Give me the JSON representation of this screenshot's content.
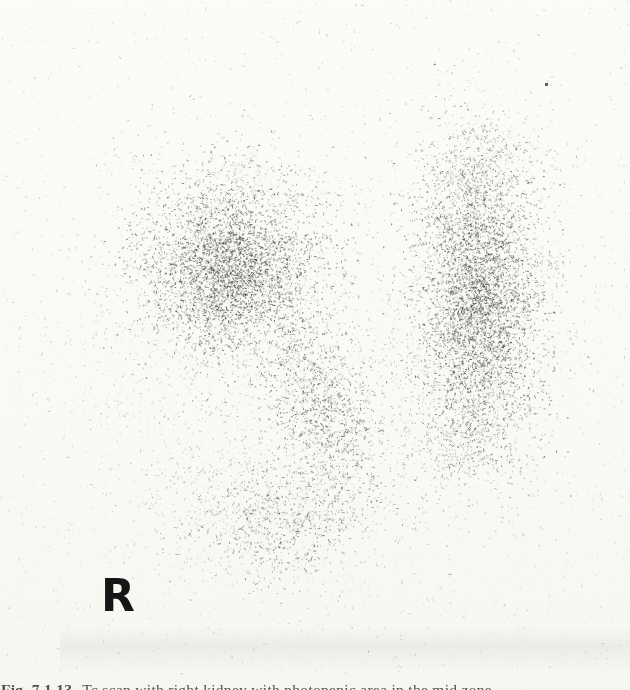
{
  "figure": {
    "orientation_label": "R",
    "caption_label": "Fig. 7.1.13",
    "caption_text": "Tc scan with right kidney with photopenic area in the mid zone"
  },
  "scan": {
    "width": 630,
    "height": 690,
    "seed": 42,
    "background": "#fbfaf7",
    "dot_color_rgb": "40,40,40",
    "clusters": [
      {
        "name": "left-upper-pole-dense",
        "cx": 233,
        "cy": 262,
        "sx": 52,
        "sy": 46,
        "n": 2600,
        "a": 0.5,
        "rot": 0
      },
      {
        "name": "left-upper-pole-core",
        "cx": 226,
        "cy": 278,
        "sx": 33,
        "sy": 34,
        "n": 1700,
        "a": 0.55,
        "rot": 0
      },
      {
        "name": "left-apex-sparse",
        "cx": 228,
        "cy": 182,
        "sx": 42,
        "sy": 24,
        "n": 260,
        "a": 0.32,
        "rot": 0
      },
      {
        "name": "left-medial-band",
        "cx": 322,
        "cy": 405,
        "sx": 26,
        "sy": 52,
        "n": 1300,
        "a": 0.48,
        "rot": -0.33
      },
      {
        "name": "left-lower-pole-blob",
        "cx": 288,
        "cy": 520,
        "sx": 42,
        "sy": 30,
        "n": 800,
        "a": 0.45,
        "rot": -0.15
      },
      {
        "name": "left-lower-lateral-sparse",
        "cx": 222,
        "cy": 500,
        "sx": 45,
        "sy": 35,
        "n": 300,
        "a": 0.3,
        "rot": 0
      },
      {
        "name": "left-field-halo",
        "cx": 252,
        "cy": 395,
        "sx": 85,
        "sy": 115,
        "n": 900,
        "a": 0.26,
        "rot": 0
      },
      {
        "name": "left-lateral-sparse",
        "cx": 140,
        "cy": 360,
        "sx": 48,
        "sy": 85,
        "n": 200,
        "a": 0.22,
        "rot": 0
      },
      {
        "name": "right-field-main",
        "cx": 481,
        "cy": 300,
        "sx": 36,
        "sy": 80,
        "n": 3000,
        "a": 0.5,
        "rot": 0
      },
      {
        "name": "right-field-core",
        "cx": 477,
        "cy": 305,
        "sx": 24,
        "sy": 56,
        "n": 1700,
        "a": 0.55,
        "rot": 0
      },
      {
        "name": "right-upper-taper",
        "cx": 472,
        "cy": 190,
        "sx": 26,
        "sy": 30,
        "n": 450,
        "a": 0.4,
        "rot": 0
      },
      {
        "name": "right-apex-sparse",
        "cx": 487,
        "cy": 148,
        "sx": 24,
        "sy": 22,
        "n": 220,
        "a": 0.3,
        "rot": 0
      },
      {
        "name": "right-lower-taper",
        "cx": 466,
        "cy": 438,
        "sx": 28,
        "sy": 28,
        "n": 430,
        "a": 0.4,
        "rot": 0
      },
      {
        "name": "right-field-halo",
        "cx": 480,
        "cy": 300,
        "sx": 58,
        "sy": 105,
        "n": 500,
        "a": 0.24,
        "rot": 0
      },
      {
        "name": "midline-sparse",
        "cx": 392,
        "cy": 420,
        "sx": 38,
        "sy": 75,
        "n": 260,
        "a": 0.22,
        "rot": 0
      }
    ],
    "noise": {
      "n": 1500,
      "a": 0.18
    },
    "grain": {
      "n": 2600,
      "a": 0.07
    },
    "specks": [
      {
        "x": 545,
        "y": 83,
        "size": 3,
        "a": 0.75
      }
    ]
  }
}
